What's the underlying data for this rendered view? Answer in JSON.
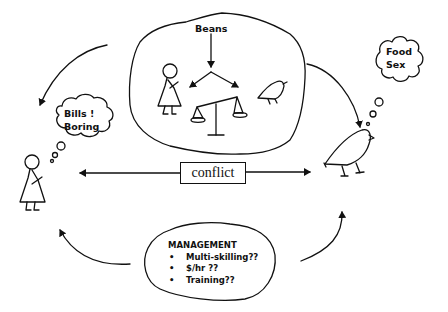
{
  "diagram": {
    "central_cloud": {
      "label": "Beans",
      "contents": [
        "woman-figure",
        "balance-scale",
        "bird-figure"
      ]
    },
    "left_thought": {
      "line1": "Bills !",
      "line2": "Boring"
    },
    "right_thought": {
      "line1": "Food",
      "line2": "Sex"
    },
    "conflict": {
      "label": "conflict"
    },
    "management": {
      "title": "MANAGEMENT",
      "items": [
        "Multi-skilling??",
        "$/hr ??",
        "Training??"
      ]
    },
    "colors": {
      "ink": "#111111",
      "background": "#ffffff"
    }
  }
}
